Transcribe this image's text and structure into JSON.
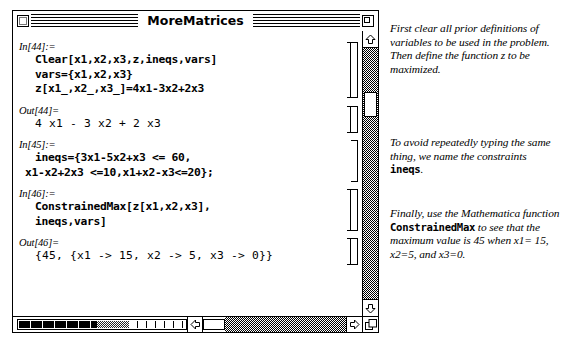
{
  "window": {
    "title": "MoreMatrices",
    "close_box": "close-box",
    "zoom_box": "zoom-box"
  },
  "notebook": {
    "cells": [
      {
        "label": "In[44]:=",
        "type": "input",
        "bracket": "double",
        "lines": [
          "Clear[x1,x2,x3,z,ineqs,vars]",
          "vars={x1,x2,x3}",
          "z[x1_,x2_,x3_]=4x1-3x2+2x3"
        ]
      },
      {
        "label": "Out[44]=",
        "type": "output",
        "bracket": "double",
        "lines": [
          "4 x1 - 3 x2 + 2 x3"
        ]
      },
      {
        "label": "In[45]:=",
        "type": "input",
        "bracket": "single",
        "lines": [
          "ineqs={3x1-5x2+x3 <= 60,",
          "x1-x2+2x3 <=10,x1+x2-x3<=20};"
        ]
      },
      {
        "label": "In[46]:=",
        "type": "input",
        "bracket": "double",
        "lines": [
          "ConstrainedMax[z[x1,x2,x3],",
          "ineqs,vars]"
        ]
      },
      {
        "label": "Out[46]=",
        "type": "output",
        "bracket": "double",
        "lines": [
          "{45, {x1 -> 15, x2 -> 5, x3 -> 0}}"
        ]
      }
    ]
  },
  "scrollbars": {
    "vertical": {
      "up_arrow": "scroll-up-arrow",
      "down_arrow": "scroll-down-arrow",
      "thumb": "scroll-thumb"
    },
    "horizontal": {
      "left_arrow": "scroll-left-arrow",
      "right_arrow": "scroll-right-arrow",
      "thumb": "scroll-thumb"
    },
    "grow_box": "grow-box"
  },
  "annotations": [
    {
      "id": "note-definitions",
      "segments": [
        {
          "text": "First clear all prior definitions of variables to be used in the problem. Then define the function ",
          "style": "italic"
        },
        {
          "text": "z",
          "style": "italic-emph"
        },
        {
          "text": " to be maximized.",
          "style": "italic"
        }
      ],
      "plain": "First clear all prior definitions of variables to be used in the problem. Then define the function z to be maximized."
    },
    {
      "id": "note-constraints",
      "segments": [
        {
          "text": "To avoid repeatedly typing the same thing, we name the constraints ",
          "style": "italic"
        },
        {
          "text": "ineqs",
          "style": "mono"
        },
        {
          "text": ".",
          "style": "italic"
        }
      ],
      "plain": "To avoid repeatedly typing the same thing, we name the constraints ineqs."
    },
    {
      "id": "note-constrainedmax",
      "segments": [
        {
          "text": "Finally, use the Mathematica function ",
          "style": "italic"
        },
        {
          "text": "ConstrainedMax",
          "style": "mono"
        },
        {
          "text": " to see that the maximum value is 45 when x1= 15, x2=5, and x3=0.",
          "style": "italic"
        }
      ],
      "plain": "Finally, use the Mathematica function ConstrainedMax to see that the maximum value is 45 when x1= 15, x2=5, and x3=0."
    }
  ],
  "colors": {
    "ink": "#000000",
    "paper": "#ffffff"
  }
}
